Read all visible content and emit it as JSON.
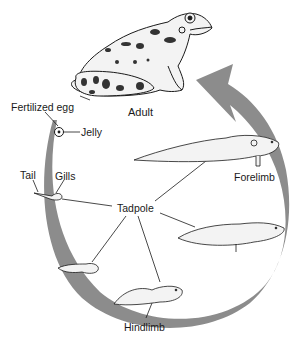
{
  "colors": {
    "arrow": "#8c8c8c",
    "ink": "#1a1a1a",
    "body_fill": "#f3f3f3",
    "spot": "#333333",
    "background": "#ffffff"
  },
  "labels": {
    "adult": "Adult",
    "fertilized_egg": "Fertilized egg",
    "jelly": "Jelly",
    "tail": "Tail",
    "gills": "Gills",
    "tadpole": "Tadpole",
    "forelimb": "Forelimb",
    "hindlimb": "Hindlimb"
  },
  "stages": [
    {
      "name": "Fertilized egg",
      "order": 1
    },
    {
      "name": "Tadpole (tail and gills)",
      "order": 2
    },
    {
      "name": "Tadpole (small)",
      "order": 3
    },
    {
      "name": "Tadpole (hindlimb)",
      "order": 4
    },
    {
      "name": "Tadpole (larger, hindlimb)",
      "order": 5
    },
    {
      "name": "Tadpole (forelimb)",
      "order": 6
    },
    {
      "name": "Adult",
      "order": 7
    }
  ],
  "icons": {
    "cycle_arrow": "clockwise-cycle-arrow-icon",
    "adult_frog": "frog-icon",
    "egg": "egg-icon",
    "tadpole": "tadpole-icon"
  }
}
